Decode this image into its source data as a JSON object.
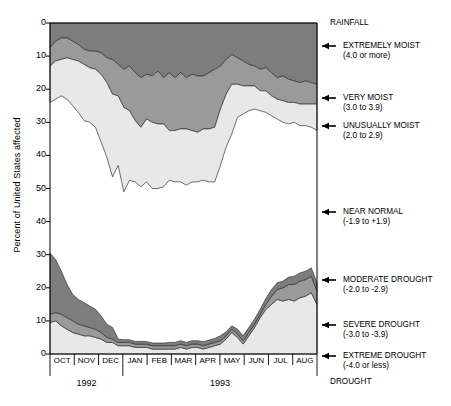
{
  "axes": {
    "y_title": "Percent of United States affected",
    "y_ticks_upper": [
      "0",
      "10",
      "20",
      "30",
      "40",
      "50"
    ],
    "y_ticks_lower": [
      "40",
      "30",
      "20",
      "10",
      "0"
    ],
    "x_ticks": [
      "OCT",
      "NOV",
      "DEC",
      "JAN",
      "FEB",
      "MAR",
      "APR",
      "MAY",
      "JUN",
      "JUL",
      "AUG"
    ],
    "years": [
      "1992",
      "1993"
    ]
  },
  "corner": {
    "top_right": "RAINFALL",
    "bottom_right": "DROUGHT"
  },
  "legend": [
    {
      "name": "extremely-moist",
      "line1": "EXTREMELY MOIST",
      "line2": "(4.0 or more)",
      "y": 46,
      "color": "#7d7d7d"
    },
    {
      "name": "very-moist",
      "line1": "VERY MOIST",
      "line2": "(3.0 to 3.9)",
      "y": 98,
      "color": "#9a9a9a"
    },
    {
      "name": "unusually-moist",
      "line1": "UNUSUALLY MOIST",
      "line2": "(2.0 to 2.9)",
      "y": 126,
      "color": "#e8e8e8"
    },
    {
      "name": "near-normal",
      "line1": "NEAR NORMAL",
      "line2": "(-1.9 to +1.9)",
      "y": 212,
      "color": "#ffffff"
    },
    {
      "name": "moderate-drought",
      "line1": "MODERATE DROUGHT",
      "line2": "(-2.0 to -2.9)",
      "y": 280,
      "color": "#e8e8e8"
    },
    {
      "name": "severe-drought",
      "line1": "SEVERE DROUGHT",
      "line2": "(-3.0 to -3.9)",
      "y": 325,
      "color": "#9a9a9a"
    },
    {
      "name": "extreme-drought",
      "line1": "EXTREME DROUGHT",
      "line2": "(-4.0 or less)",
      "y": 356,
      "color": "#7d7d7d"
    }
  ],
  "chart_data": {
    "type": "area",
    "title": "",
    "subtitle": "",
    "xlabel": "",
    "ylabel": "Percent of United States affected",
    "grid": false,
    "legend_position": "right",
    "note": "Mirrored stacked area chart. Upper half (RAINFALL) stacks downward from 0 at top of plot; lower half (DROUGHT) stacks upward from 0 at bottom of plot. Values are percent of United States affected, read weekly from Oct 1992 through Aug 1993.",
    "x": [
      "1992-10-03",
      "1992-10-10",
      "1992-10-17",
      "1992-10-24",
      "1992-10-31",
      "1992-11-07",
      "1992-11-14",
      "1992-11-21",
      "1992-11-28",
      "1992-12-05",
      "1992-12-12",
      "1992-12-19",
      "1992-12-26",
      "1993-01-02",
      "1993-01-09",
      "1993-01-16",
      "1993-01-23",
      "1993-01-30",
      "1993-02-06",
      "1993-02-13",
      "1993-02-20",
      "1993-02-27",
      "1993-03-06",
      "1993-03-13",
      "1993-03-20",
      "1993-03-27",
      "1993-04-03",
      "1993-04-10",
      "1993-04-17",
      "1993-04-24",
      "1993-05-01",
      "1993-05-08",
      "1993-05-15",
      "1993-05-22",
      "1993-05-29",
      "1993-06-05",
      "1993-06-12",
      "1993-06-19",
      "1993-06-26",
      "1993-07-03",
      "1993-07-10",
      "1993-07-17",
      "1993-07-24",
      "1993-07-31",
      "1993-08-07",
      "1993-08-14",
      "1993-08-21",
      "1993-08-28"
    ],
    "x_axis_months": [
      "OCT",
      "NOV",
      "DEC",
      "JAN",
      "FEB",
      "MAR",
      "APR",
      "MAY",
      "JUN",
      "JUL",
      "AUG"
    ],
    "y_axis": {
      "upper_label": "RAINFALL",
      "upper_ticks": [
        0,
        10,
        20,
        30,
        40,
        50
      ],
      "lower_label": "DROUGHT",
      "lower_ticks": [
        40,
        30,
        20,
        10,
        0
      ]
    },
    "series": [
      {
        "name": "EXTREMELY MOIST",
        "range": "(4.0 or more)",
        "half": "rainfall",
        "color": "#7d7d7d",
        "values": [
          7.5,
          5.5,
          4.5,
          4.5,
          5.5,
          6.5,
          8.0,
          8.5,
          8.5,
          9.0,
          10.5,
          11.0,
          12.5,
          14.0,
          13.0,
          15.0,
          16.5,
          15.5,
          16.0,
          14.5,
          16.5,
          15.0,
          16.5,
          15.0,
          16.5,
          15.5,
          16.0,
          16.0,
          15.0,
          14.0,
          13.0,
          11.0,
          9.5,
          10.5,
          11.5,
          12.5,
          13.0,
          14.0,
          13.5,
          15.0,
          16.5,
          16.0,
          17.0,
          17.5,
          18.0,
          17.5,
          18.0,
          18.5
        ]
      },
      {
        "name": "VERY MOIST",
        "range": "(3.0 to 3.9)",
        "half": "rainfall",
        "color": "#9a9a9a",
        "values": [
          5.5,
          6.0,
          6.5,
          6.0,
          5.5,
          5.0,
          4.5,
          5.0,
          5.5,
          6.5,
          7.5,
          10.5,
          9.5,
          11.5,
          13.5,
          14.5,
          15.0,
          13.5,
          14.0,
          16.0,
          14.0,
          17.5,
          16.0,
          17.0,
          15.5,
          17.0,
          17.0,
          16.0,
          17.0,
          17.5,
          13.0,
          10.5,
          9.0,
          8.0,
          7.5,
          6.5,
          6.0,
          6.5,
          7.0,
          7.0,
          6.5,
          7.5,
          7.0,
          6.5,
          6.5,
          7.0,
          6.5,
          6.0
        ]
      },
      {
        "name": "UNUSUALLY MOIST",
        "range": "(2.0 to 2.9)",
        "half": "rainfall",
        "color": "#e8e8e8",
        "values": [
          11.0,
          11.5,
          11.0,
          12.5,
          14.0,
          15.5,
          17.0,
          16.5,
          17.5,
          20.5,
          22.5,
          25.0,
          21.0,
          25.5,
          21.0,
          18.5,
          18.0,
          19.0,
          20.0,
          19.5,
          19.0,
          15.0,
          15.5,
          16.0,
          17.0,
          15.5,
          15.0,
          15.5,
          16.0,
          16.5,
          17.0,
          16.0,
          15.0,
          10.0,
          8.5,
          7.5,
          7.0,
          6.0,
          6.5,
          6.0,
          6.0,
          6.5,
          6.5,
          6.0,
          6.5,
          6.5,
          7.0,
          8.0
        ]
      },
      {
        "name": "MODERATE DROUGHT",
        "range": "(-2.0 to -2.9)",
        "half": "drought",
        "color": "#e8e8e8",
        "values": [
          9.5,
          10.0,
          8.5,
          7.5,
          6.5,
          6.0,
          5.5,
          5.5,
          5.0,
          4.5,
          3.5,
          3.5,
          2.5,
          2.5,
          2.5,
          2.0,
          2.0,
          2.0,
          1.5,
          1.5,
          1.5,
          1.5,
          1.5,
          2.0,
          1.5,
          2.0,
          2.0,
          1.5,
          2.0,
          2.5,
          3.0,
          4.5,
          6.5,
          5.0,
          3.0,
          5.5,
          8.0,
          11.0,
          13.5,
          15.0,
          16.5,
          16.0,
          16.5,
          16.0,
          17.0,
          17.5,
          18.5,
          15.0
        ]
      },
      {
        "name": "SEVERE DROUGHT",
        "range": "(-3.0 to -3.9)",
        "half": "drought",
        "color": "#9a9a9a",
        "values": [
          2.5,
          2.5,
          3.5,
          3.5,
          3.5,
          3.0,
          3.0,
          2.5,
          2.5,
          2.0,
          1.5,
          1.0,
          1.0,
          1.0,
          1.0,
          1.0,
          1.0,
          1.0,
          1.0,
          1.0,
          1.0,
          1.0,
          1.0,
          1.0,
          1.0,
          1.0,
          1.0,
          1.0,
          1.0,
          1.0,
          1.0,
          1.0,
          1.0,
          1.0,
          1.0,
          1.0,
          1.0,
          1.0,
          1.5,
          2.5,
          3.0,
          4.0,
          4.5,
          5.0,
          5.0,
          5.0,
          5.0,
          4.0
        ]
      },
      {
        "name": "EXTREME DROUGHT",
        "range": "(-4.0 or less)",
        "half": "drought",
        "color": "#7d7d7d",
        "values": [
          18.5,
          16.0,
          13.0,
          10.0,
          8.0,
          7.5,
          7.0,
          6.5,
          6.0,
          5.0,
          4.0,
          3.5,
          1.0,
          0.8,
          0.8,
          0.8,
          0.8,
          0.8,
          0.8,
          0.8,
          0.8,
          1.0,
          1.0,
          1.0,
          1.0,
          1.0,
          1.0,
          1.2,
          1.2,
          1.2,
          1.5,
          1.2,
          1.0,
          1.5,
          1.5,
          1.5,
          1.5,
          1.5,
          1.8,
          2.0,
          2.0,
          2.0,
          2.2,
          2.5,
          2.5,
          2.5,
          2.5,
          2.5
        ]
      }
    ]
  },
  "plot_geometry": {
    "left": 50,
    "right": 317,
    "top": 23,
    "bottom": 354,
    "mid_upper_zero": 23,
    "mid_lower_zero": 354,
    "px_per_10pct": 33.1
  },
  "colors": {
    "dark_gray": "#7d7d7d",
    "mid_gray": "#9a9a9a",
    "light_gray": "#e8e8e8",
    "white": "#ffffff",
    "outline": "#333333",
    "axis": "#000000"
  }
}
